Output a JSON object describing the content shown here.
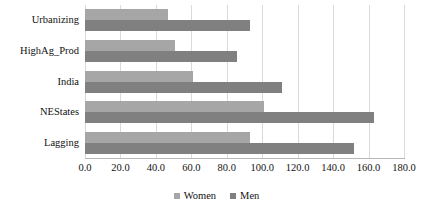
{
  "chart_data": {
    "type": "bar",
    "orientation": "horizontal",
    "title": "",
    "xlabel": "",
    "ylabel": "",
    "categories": [
      "Urbanizing",
      "HighAg_Prod",
      "India",
      "NEStates",
      "Lagging"
    ],
    "series": [
      {
        "name": "Women",
        "color": "#a6a6a6",
        "values": [
          47,
          51,
          61,
          101,
          93
        ]
      },
      {
        "name": "Men",
        "color": "#808080",
        "values": [
          93,
          86,
          111,
          163,
          152
        ]
      }
    ],
    "xlim": [
      0,
      180
    ],
    "xticks": [
      0,
      20,
      40,
      60,
      80,
      100,
      120,
      140,
      160,
      180
    ],
    "xtick_labels": [
      "0.0",
      "20.0",
      "40.0",
      "60.0",
      "80.0",
      "100.0",
      "120.0",
      "140.0",
      "160.0",
      "180.0"
    ],
    "grid": "vertical",
    "legend_position": "bottom",
    "legend": [
      {
        "label": "Women",
        "color": "#a6a6a6",
        "marker": "square-swatch"
      },
      {
        "label": "Men",
        "color": "#808080",
        "marker": "square-swatch"
      }
    ]
  }
}
